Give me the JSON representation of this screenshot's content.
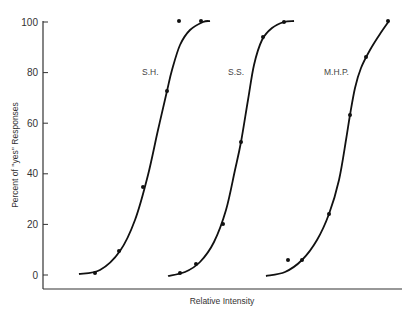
{
  "chart_data": {
    "type": "scatter",
    "title": "",
    "xlabel": "Relative Intensity",
    "ylabel": "Percent of ''yes'' Responses",
    "ylim": [
      0,
      100
    ],
    "yticks": [
      0,
      20,
      40,
      60,
      80,
      100
    ],
    "xticks": [],
    "grid": false,
    "legend": "inline labels",
    "series": [
      {
        "name": "S.H.",
        "label_pos": [
          142,
          75
        ],
        "points_px": [
          [
            95,
            273
          ],
          [
            119,
            251
          ],
          [
            143,
            187
          ],
          [
            167,
            91
          ],
          [
            179,
            21
          ],
          [
            201,
            21
          ]
        ],
        "values": [
          1,
          10,
          35,
          72,
          100,
          100
        ],
        "curve_px": [
          [
            79,
            274
          ],
          [
            100,
            270
          ],
          [
            120,
            251
          ],
          [
            135,
            220
          ],
          [
            148,
            175
          ],
          [
            158,
            130
          ],
          [
            167,
            91
          ],
          [
            172,
            70
          ],
          [
            180,
            45
          ],
          [
            190,
            30
          ],
          [
            203,
            22
          ],
          [
            210,
            21
          ]
        ]
      },
      {
        "name": "S.S.",
        "label_pos": [
          228,
          75
        ],
        "points_px": [
          [
            180,
            273
          ],
          [
            196,
            264
          ],
          [
            223,
            224
          ],
          [
            241,
            142
          ],
          [
            263,
            37
          ],
          [
            284,
            22
          ]
        ],
        "values": [
          1,
          4,
          20,
          52,
          94,
          100
        ],
        "curve_px": [
          [
            168,
            276
          ],
          [
            185,
            272
          ],
          [
            200,
            262
          ],
          [
            214,
            242
          ],
          [
            226,
            210
          ],
          [
            235,
            170
          ],
          [
            241,
            142
          ],
          [
            248,
            100
          ],
          [
            254,
            65
          ],
          [
            262,
            40
          ],
          [
            272,
            28
          ],
          [
            284,
            22
          ],
          [
            294,
            21
          ]
        ]
      },
      {
        "name": "M.H.P.",
        "label_pos": [
          324,
          75
        ],
        "points_px": [
          [
            288,
            260
          ],
          [
            302,
            260
          ],
          [
            329,
            214
          ],
          [
            350,
            115
          ],
          [
            366,
            57
          ],
          [
            388,
            21
          ]
        ],
        "values": [
          6,
          6,
          24,
          63,
          86,
          100
        ],
        "curve_px": [
          [
            266,
            276
          ],
          [
            285,
            272
          ],
          [
            302,
            260
          ],
          [
            317,
            240
          ],
          [
            329,
            214
          ],
          [
            339,
            180
          ],
          [
            346,
            140
          ],
          [
            350,
            115
          ],
          [
            355,
            88
          ],
          [
            361,
            68
          ],
          [
            370,
            50
          ],
          [
            380,
            34
          ],
          [
            389,
            21
          ]
        ]
      }
    ]
  }
}
